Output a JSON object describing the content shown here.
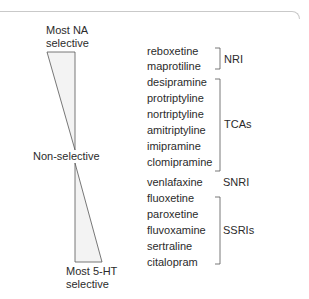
{
  "scale": {
    "top_label_line1": "Most NA",
    "top_label_line2": "selective",
    "middle_label": "Non-selective",
    "bottom_label_line1": "Most 5-HT",
    "bottom_label_line2": "selective"
  },
  "drugs": [
    "reboxetine",
    "maprotiline",
    "desipramine",
    "protriptyline",
    "nortriptyline",
    "amitriptyline",
    "imipramine",
    "clomipramine",
    "venlafaxine",
    "fluoxetine",
    "paroxetine",
    "fluvoxamine",
    "sertraline",
    "citalopram"
  ],
  "classes": [
    {
      "label": "NRI",
      "members": [
        "reboxetine",
        "maprotiline"
      ]
    },
    {
      "label": "TCAs",
      "members": [
        "desipramine",
        "protriptyline",
        "nortriptyline",
        "amitriptyline",
        "imipramine",
        "clomipramine"
      ]
    },
    {
      "label": "SNRI",
      "members": [
        "venlafaxine"
      ]
    },
    {
      "label": "SSRIs",
      "members": [
        "fluoxetine",
        "paroxetine",
        "fluvoxamine",
        "sertraline",
        "citalopram"
      ]
    }
  ],
  "colors": {
    "text": "#2b2b2b",
    "line": "#555555",
    "triangle_fill": "#f3f3f3",
    "frame": "#c9c9c9"
  }
}
